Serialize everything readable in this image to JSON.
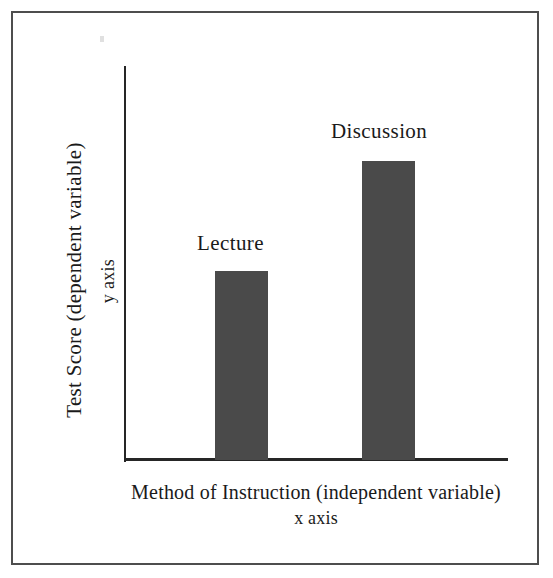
{
  "figure": {
    "background_color": "#ffffff",
    "frame_color": "#4e4e4e",
    "axis_color": "#262626"
  },
  "axes": {
    "y_title_main": "Test Score (dependent variable)",
    "y_title_sub": "y axis",
    "x_title_main": "Method of Instruction (independent variable)",
    "x_title_sub": "x axis"
  },
  "chart_data": {
    "type": "bar",
    "title": "",
    "categories": [
      "Lecture",
      "Discussion"
    ],
    "values": [
      48,
      76
    ],
    "bar_color": "#4a4a4a",
    "xlabel": "Method of Instruction (independent variable)",
    "ylabel": "Test Score (dependent variable)",
    "xlabel_sub": "x axis",
    "ylabel_sub": "y axis",
    "ylim": [
      0,
      100
    ],
    "grid": false,
    "legend": "none",
    "tick_labels_shown": false,
    "annotations": [
      {
        "text": "Lecture",
        "position": "above-bar",
        "category": "Lecture"
      },
      {
        "text": "Discussion",
        "position": "above-bar",
        "category": "Discussion"
      }
    ]
  }
}
